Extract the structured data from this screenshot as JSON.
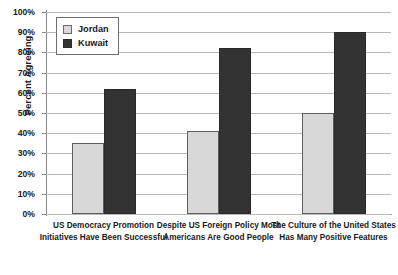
{
  "chart_data": {
    "type": "bar",
    "title": "",
    "subtitle": "",
    "xlabel": "",
    "ylabel": "Percent Agreeing",
    "ylim": [
      0,
      100
    ],
    "y_tick_labels": [
      "100%",
      "90%",
      "80%",
      "70%",
      "60%",
      "50%",
      "40%",
      "30%",
      "20%",
      "10%",
      "0%"
    ],
    "y_tick_values": [
      100,
      90,
      80,
      70,
      60,
      50,
      40,
      30,
      20,
      10,
      0
    ],
    "grid": true,
    "legend_position": "top-left",
    "categories": [
      "US Democracy Promotion Initiatives Have Been Successful",
      "Despite US Foreign Policy Most Americans Are Good People",
      "The Culture of the United States Has Many Positive Features"
    ],
    "category_lines": [
      [
        "US Democracy Promotion",
        "Initiatives Have Been Successful"
      ],
      [
        "Despite US Foreign Policy Most",
        "Americans Are Good People"
      ],
      [
        "The Culture of the United States",
        "Has Many Positive Features"
      ]
    ],
    "series": [
      {
        "name": "Jordan",
        "color": "#d8d8d8",
        "values": [
          35,
          41,
          50
        ]
      },
      {
        "name": "Kuwait",
        "color": "#333333",
        "values": [
          62,
          82,
          90
        ]
      }
    ]
  },
  "legend": {
    "items": [
      {
        "label": "Jordan",
        "swatch": "jordan-swatch"
      },
      {
        "label": "Kuwait",
        "swatch": "kuwait-swatch"
      }
    ]
  }
}
